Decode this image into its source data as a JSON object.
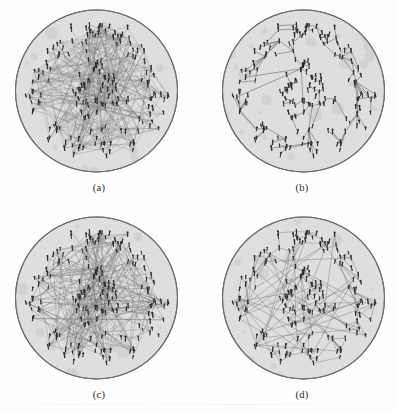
{
  "figure": {
    "background_color": "#ffffff",
    "disc_fill_color": "#dedede",
    "disc_stroke_color": "#6e6e6e",
    "node_color": "#2e2e2e",
    "edge_color": "#737373",
    "caption_color": "#2b2b2b"
  },
  "panels": [
    {
      "id": "a",
      "caption": "(a)",
      "description": "Full graph with all edges drawn, dense crossing link structure",
      "edge_density": "high",
      "layout": "radial-clustered",
      "node_count": 186,
      "edge_count": 310,
      "edge_opacity": 0.55,
      "edge_width": 0.5,
      "seed": 11
    },
    {
      "id": "b",
      "caption": "(b)",
      "description": "Spanning tree extracted from the graph, two dominant hub nodes",
      "edge_density": "low",
      "layout": "spanning-tree",
      "node_count": 186,
      "edge_count": 185,
      "edge_opacity": 0.85,
      "edge_width": 0.75,
      "seed": 23
    },
    {
      "id": "c",
      "caption": "(c)",
      "description": "Graph with long-range edges emphasised, moderately dense",
      "edge_density": "medium-high",
      "layout": "radial-clustered",
      "node_count": 186,
      "edge_count": 240,
      "edge_opacity": 0.6,
      "edge_width": 0.55,
      "seed": 37
    },
    {
      "id": "d",
      "caption": "(d)",
      "description": "Sparsified graph, tree backbone plus extra shortcut edges",
      "edge_density": "medium",
      "layout": "radial-clustered",
      "node_count": 186,
      "edge_count": 205,
      "edge_opacity": 0.7,
      "edge_width": 0.6,
      "seed": 53
    }
  ],
  "chart_data": {
    "type": "scatter",
    "xlabel": "",
    "ylabel": "",
    "categories": [
      "(a)",
      "(b)",
      "(c)",
      "(d)"
    ],
    "series": [
      {
        "name": "nodes",
        "values": [
          186,
          186,
          186,
          186
        ]
      },
      {
        "name": "edges",
        "values": [
          310,
          185,
          240,
          205
        ]
      }
    ],
    "annotations": [
      "(a)",
      "(b)",
      "(c)",
      "(d)"
    ],
    "legend_position": "none",
    "grid": false
  }
}
